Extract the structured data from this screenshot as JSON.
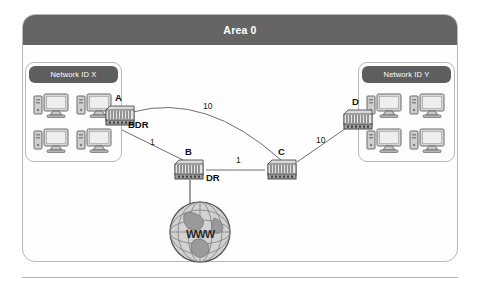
{
  "figure": {
    "title": "Area 0",
    "type": "ospf-network-topology"
  },
  "area": {
    "header_label": "Area 0",
    "header_bg": "#656565",
    "header_text_color": "#ffffff",
    "border_color": "#b9b9b9"
  },
  "networks": [
    {
      "id": "left",
      "label": "Network ID X",
      "host_count": 4,
      "host_icon": "desktop-computer-icon"
    },
    {
      "id": "right",
      "label": "Network ID Y",
      "host_count": 4,
      "host_icon": "desktop-computer-icon"
    }
  ],
  "routers": [
    {
      "id": "A",
      "label": "A",
      "role": "BDR",
      "icon": "router-icon"
    },
    {
      "id": "B",
      "label": "B",
      "role": "DR",
      "icon": "router-icon"
    },
    {
      "id": "C",
      "label": "C",
      "role": "",
      "icon": "router-icon"
    },
    {
      "id": "D",
      "label": "D",
      "role": "",
      "icon": "router-icon"
    }
  ],
  "router_roles": {
    "a_role": "BDR",
    "b_role": "DR"
  },
  "links": [
    {
      "id": "a-c",
      "from": "A",
      "to": "C",
      "cost": "10",
      "style": "curved"
    },
    {
      "id": "a-b",
      "from": "A",
      "to": "B",
      "cost": "1",
      "style": "straight"
    },
    {
      "id": "b-c",
      "from": "B",
      "to": "C",
      "cost": "1",
      "style": "straight"
    },
    {
      "id": "c-d",
      "from": "C",
      "to": "D",
      "cost": "10",
      "style": "straight"
    },
    {
      "id": "b-internet",
      "from": "B",
      "to": "Internet",
      "cost": "",
      "style": "straight"
    }
  ],
  "costs": {
    "ac": "10",
    "ab": "1",
    "bc": "1",
    "cd": "10"
  },
  "internet": {
    "label": "WWW",
    "icon": "globe-icon"
  },
  "colors": {
    "panel_border": "#b9b9b9",
    "header_bg": "#656565",
    "group_header_bg": "#5e5e5e",
    "link_line": "#6f6f6f",
    "text": "#111111",
    "page_bg": "#ffffff"
  }
}
